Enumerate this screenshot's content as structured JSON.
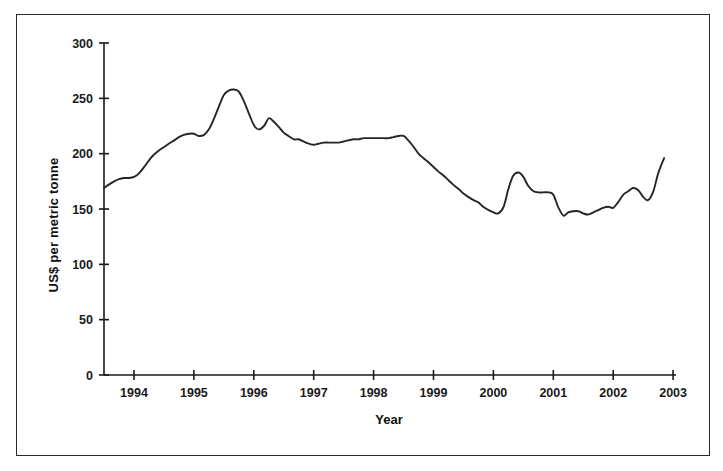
{
  "chart_data": {
    "type": "line",
    "title": "",
    "subtitle": "",
    "xlabel": "Year",
    "ylabel": "US$ per metric tonne",
    "xlim": [
      1993.5,
      2002.85
    ],
    "ylim": [
      0,
      300
    ],
    "yticks": [
      0,
      50,
      100,
      150,
      200,
      250,
      300
    ],
    "ytick_labels": [
      "0",
      "50",
      "100",
      "150",
      "200",
      "250",
      "300"
    ],
    "xticks": [
      1994,
      1995,
      1996,
      1997,
      1998,
      1999,
      2000,
      2001,
      2002,
      2003
    ],
    "xtick_labels": [
      "1994",
      "1995",
      "1996",
      "1997",
      "1998",
      "1999",
      "2000",
      "2001",
      "2002",
      "2003"
    ],
    "grid": false,
    "legend": "none",
    "line_color": "#262626",
    "series": [
      {
        "name": "Price",
        "x": [
          1993.5,
          1993.58,
          1993.67,
          1993.75,
          1993.83,
          1993.92,
          1994.0,
          1994.08,
          1994.17,
          1994.25,
          1994.33,
          1994.42,
          1994.5,
          1994.58,
          1994.67,
          1994.75,
          1994.83,
          1994.92,
          1995.0,
          1995.08,
          1995.17,
          1995.25,
          1995.33,
          1995.42,
          1995.5,
          1995.58,
          1995.67,
          1995.75,
          1995.83,
          1995.92,
          1996.0,
          1996.08,
          1996.17,
          1996.25,
          1996.33,
          1996.42,
          1996.5,
          1996.58,
          1996.67,
          1996.75,
          1996.83,
          1996.92,
          1997.0,
          1997.08,
          1997.17,
          1997.25,
          1997.33,
          1997.42,
          1997.5,
          1997.58,
          1997.67,
          1997.75,
          1997.83,
          1997.92,
          1998.0,
          1998.08,
          1998.17,
          1998.25,
          1998.33,
          1998.42,
          1998.5,
          1998.58,
          1998.67,
          1998.75,
          1998.83,
          1998.92,
          1999.0,
          1999.08,
          1999.17,
          1999.25,
          1999.33,
          1999.42,
          1999.5,
          1999.58,
          1999.67,
          1999.75,
          1999.83,
          1999.92,
          2000.0,
          2000.08,
          2000.17,
          2000.25,
          2000.33,
          2000.42,
          2000.5,
          2000.58,
          2000.67,
          2000.75,
          2000.83,
          2000.92,
          2001.0,
          2001.08,
          2001.17,
          2001.25,
          2001.33,
          2001.42,
          2001.5,
          2001.58,
          2001.67,
          2001.75,
          2001.83,
          2001.92,
          2002.0,
          2002.08,
          2002.17,
          2002.25,
          2002.33,
          2002.42,
          2002.5,
          2002.58,
          2002.67,
          2002.75,
          2002.85
        ],
        "values": [
          169,
          172,
          175,
          177,
          178,
          178,
          179,
          182,
          188,
          194,
          199,
          203,
          206,
          209,
          212,
          215,
          217,
          218,
          218,
          216,
          217,
          222,
          231,
          243,
          253,
          257,
          258,
          256,
          248,
          236,
          226,
          222,
          225,
          232,
          229,
          224,
          219,
          216,
          213,
          213,
          211,
          209,
          208,
          209,
          210,
          210,
          210,
          210,
          211,
          212,
          213,
          213,
          214,
          214,
          214,
          214,
          214,
          214,
          215,
          216,
          216,
          212,
          206,
          200,
          196,
          192,
          188,
          184,
          180,
          176,
          172,
          168,
          164,
          161,
          158,
          156,
          152,
          149,
          147,
          146,
          152,
          168,
          180,
          183,
          179,
          171,
          166,
          165,
          165,
          165,
          163,
          152,
          144,
          147,
          148,
          148,
          146,
          145,
          147,
          149,
          151,
          152,
          151,
          156,
          163,
          166,
          169,
          167,
          161,
          158,
          166,
          182,
          196
        ]
      }
    ],
    "annotations": []
  },
  "figure": {
    "border_color": "#2a2a2a",
    "background": "#ffffff"
  }
}
